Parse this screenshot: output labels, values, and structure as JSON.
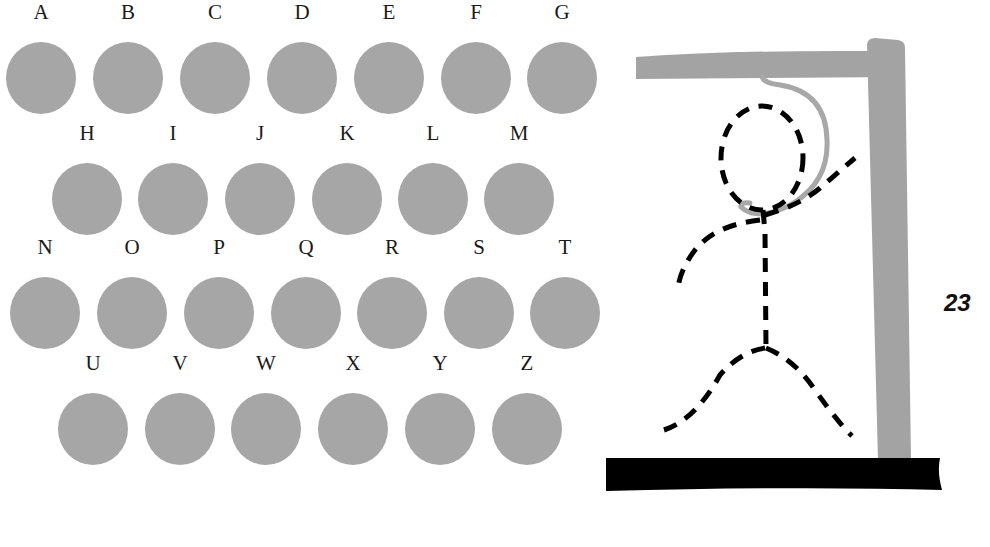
{
  "game": {
    "title": "Hangman",
    "score": "23",
    "colors": {
      "letter_disc": "#a6a6a6",
      "gallows": "#a3a3a3",
      "rope": "#a8a8a8",
      "figure": "#000000",
      "base": "#000000"
    }
  },
  "keyboard": {
    "rows": [
      [
        {
          "letter": "A",
          "x": 6,
          "y": 42
        },
        {
          "letter": "B",
          "x": 93,
          "y": 42
        },
        {
          "letter": "C",
          "x": 180,
          "y": 42
        },
        {
          "letter": "D",
          "x": 267,
          "y": 42
        },
        {
          "letter": "E",
          "x": 354,
          "y": 42
        },
        {
          "letter": "F",
          "x": 441,
          "y": 42
        },
        {
          "letter": "G",
          "x": 527,
          "y": 42
        }
      ],
      [
        {
          "letter": "H",
          "x": 52,
          "y": 163
        },
        {
          "letter": "I",
          "x": 138,
          "y": 163
        },
        {
          "letter": "J",
          "x": 225,
          "y": 163
        },
        {
          "letter": "K",
          "x": 312,
          "y": 163
        },
        {
          "letter": "L",
          "x": 398,
          "y": 163
        },
        {
          "letter": "M",
          "x": 484,
          "y": 163
        }
      ],
      [
        {
          "letter": "N",
          "x": 10,
          "y": 277
        },
        {
          "letter": "O",
          "x": 97,
          "y": 277
        },
        {
          "letter": "P",
          "x": 184,
          "y": 277
        },
        {
          "letter": "Q",
          "x": 271,
          "y": 277
        },
        {
          "letter": "R",
          "x": 357,
          "y": 277
        },
        {
          "letter": "S",
          "x": 444,
          "y": 277
        },
        {
          "letter": "T",
          "x": 530,
          "y": 277
        }
      ],
      [
        {
          "letter": "U",
          "x": 58,
          "y": 393
        },
        {
          "letter": "V",
          "x": 145,
          "y": 393
        },
        {
          "letter": "W",
          "x": 231,
          "y": 393
        },
        {
          "letter": "X",
          "x": 318,
          "y": 393
        },
        {
          "letter": "Y",
          "x": 405,
          "y": 393
        },
        {
          "letter": "Z",
          "x": 492,
          "y": 393
        }
      ]
    ]
  }
}
